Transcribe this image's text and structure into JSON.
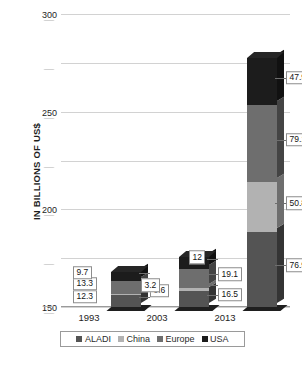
{
  "chart_data": {
    "type": "bar",
    "subtype": "stacked-column-3d",
    "title": "",
    "xlabel": "",
    "ylabel": "IN BILLIONS OF US$",
    "categories": [
      "1993",
      "2003",
      "2013"
    ],
    "series": [
      {
        "name": "ALADI",
        "color": "#545454",
        "values": [
          12.3,
          16.5,
          76.9
        ],
        "labels": [
          "12.3",
          "16.5",
          "76.9"
        ]
      },
      {
        "name": "China",
        "color": "#b2b2b2",
        "values": [
          0.6,
          3.2,
          50.8
        ],
        "labels": [
          "0.6",
          "3.2",
          "50.8"
        ]
      },
      {
        "name": "Europe",
        "color": "#6e6e6e",
        "values": [
          13.3,
          19.1,
          79.1
        ],
        "labels": [
          "13.3",
          "19.1",
          "79.1"
        ]
      },
      {
        "name": "USA",
        "color": "#1c1c1c",
        "values": [
          9.7,
          12.0,
          47.9
        ],
        "labels": [
          "9.7",
          "12",
          "47.9"
        ]
      }
    ],
    "totals": [
      35.9,
      50.8,
      254.7
    ],
    "ylim": [
      0,
      300
    ],
    "yticks": [
      "0",
      "50",
      "100",
      "150",
      "200",
      "250",
      "300"
    ],
    "ytick_values": [
      0,
      50,
      100,
      150,
      200,
      250,
      300
    ],
    "grid": true,
    "legend_position": "bottom"
  },
  "axis": {
    "y_title": "IN BILLIONS OF US$"
  },
  "legend": {
    "items": [
      {
        "label": "ALADI",
        "color": "#545454"
      },
      {
        "label": "China",
        "color": "#b2b2b2"
      },
      {
        "label": "Europe",
        "color": "#6e6e6e"
      },
      {
        "label": "USA",
        "color": "#1c1c1c"
      }
    ]
  }
}
